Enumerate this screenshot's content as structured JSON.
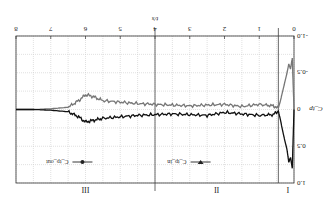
{
  "chart_data": {
    "type": "line",
    "title": "",
    "xlabel": "t/s",
    "ylabel": "C_tp",
    "xlim": [
      0,
      8
    ],
    "ylim": [
      -1.0,
      1.0
    ],
    "xticks": [
      "0",
      "1",
      "2",
      "3",
      "4",
      "5",
      "6",
      "7",
      "8"
    ],
    "yticks": [
      "-1.0",
      "-0.5",
      "0",
      "0.5",
      "1.0"
    ],
    "grid": true,
    "legend": {
      "position": "lower center",
      "entries": [
        "C_tp_in",
        "C_tp_out"
      ]
    },
    "regions": [
      {
        "label": "I",
        "from": 0,
        "to": 0.45
      },
      {
        "label": "II",
        "from": 0.45,
        "to": 4
      },
      {
        "label": "III",
        "from": 4,
        "to": 8
      }
    ],
    "series": [
      {
        "name": "C_tp_in",
        "marker": "triangle",
        "color": "#777777",
        "x": [
          0,
          0.05,
          0.1,
          0.15,
          0.2,
          0.3,
          0.4,
          0.45,
          0.6,
          1.0,
          1.5,
          2.0,
          2.5,
          3.0,
          3.5,
          4.0,
          4.5,
          5.0,
          5.5,
          5.8,
          6.0,
          6.2,
          6.5,
          7.0,
          7.5,
          8.0
        ],
        "y": [
          0.0,
          -0.7,
          -0.55,
          -0.62,
          -0.5,
          -0.3,
          -0.1,
          -0.02,
          -0.05,
          -0.07,
          -0.04,
          -0.07,
          -0.06,
          -0.05,
          -0.06,
          -0.07,
          -0.08,
          -0.1,
          -0.12,
          -0.18,
          -0.2,
          -0.12,
          -0.03,
          -0.01,
          0.0,
          0.0
        ]
      },
      {
        "name": "C_tp_out",
        "marker": "circle",
        "color": "#111111",
        "x": [
          0,
          0.05,
          0.1,
          0.15,
          0.2,
          0.3,
          0.4,
          0.45,
          0.6,
          1.0,
          1.5,
          2.0,
          2.5,
          3.0,
          3.5,
          4.0,
          4.5,
          5.0,
          5.5,
          5.8,
          6.0,
          6.2,
          6.5,
          7.0,
          7.5,
          8.0
        ],
        "y": [
          0.0,
          0.8,
          0.65,
          0.72,
          0.55,
          0.35,
          0.12,
          0.02,
          0.07,
          0.08,
          0.06,
          0.04,
          0.08,
          0.07,
          0.06,
          0.07,
          0.08,
          0.1,
          0.12,
          0.15,
          0.17,
          0.1,
          0.03,
          0.01,
          0.0,
          0.0
        ]
      }
    ]
  },
  "caption": "(upside-down figure caption, illegible)"
}
